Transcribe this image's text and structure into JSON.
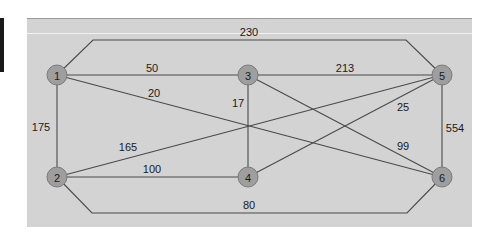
{
  "diagram": {
    "type": "weighted-undirected-graph",
    "nodes": [
      {
        "id": "1",
        "label": "1",
        "x": 57,
        "y": 75
      },
      {
        "id": "2",
        "label": "2",
        "x": 57,
        "y": 177
      },
      {
        "id": "3",
        "label": "3",
        "x": 248,
        "y": 75
      },
      {
        "id": "4",
        "label": "4",
        "x": 248,
        "y": 177
      },
      {
        "id": "5",
        "label": "5",
        "x": 442,
        "y": 75
      },
      {
        "id": "6",
        "label": "6",
        "x": 442,
        "y": 177
      }
    ],
    "edges": [
      {
        "from": "1",
        "to": "5",
        "weight": "230"
      },
      {
        "from": "1",
        "to": "3",
        "weight": "50"
      },
      {
        "from": "1",
        "to": "6",
        "weight": "20"
      },
      {
        "from": "1",
        "to": "2",
        "weight": "175"
      },
      {
        "from": "3",
        "to": "5",
        "weight": "213"
      },
      {
        "from": "3",
        "to": "4",
        "weight": "17"
      },
      {
        "from": "3",
        "to": "6",
        "weight": "99"
      },
      {
        "from": "2",
        "to": "5",
        "weight": "165"
      },
      {
        "from": "4",
        "to": "5",
        "weight": "25"
      },
      {
        "from": "2",
        "to": "4",
        "weight": "100"
      },
      {
        "from": "5",
        "to": "6",
        "weight": "554"
      },
      {
        "from": "2",
        "to": "6",
        "weight": "80"
      }
    ]
  },
  "labels": {
    "n1": "1",
    "n2": "2",
    "n3": "3",
    "n4": "4",
    "n5": "5",
    "n6": "6",
    "w_1_5": "230",
    "w_1_3": "50",
    "w_1_6": "20",
    "w_1_2": "175",
    "w_3_5": "213",
    "w_3_4": "17",
    "w_3_6": "99",
    "w_2_5": "165",
    "w_4_5": "25",
    "w_2_4": "100",
    "w_5_6": "554",
    "w_2_6": "80"
  }
}
